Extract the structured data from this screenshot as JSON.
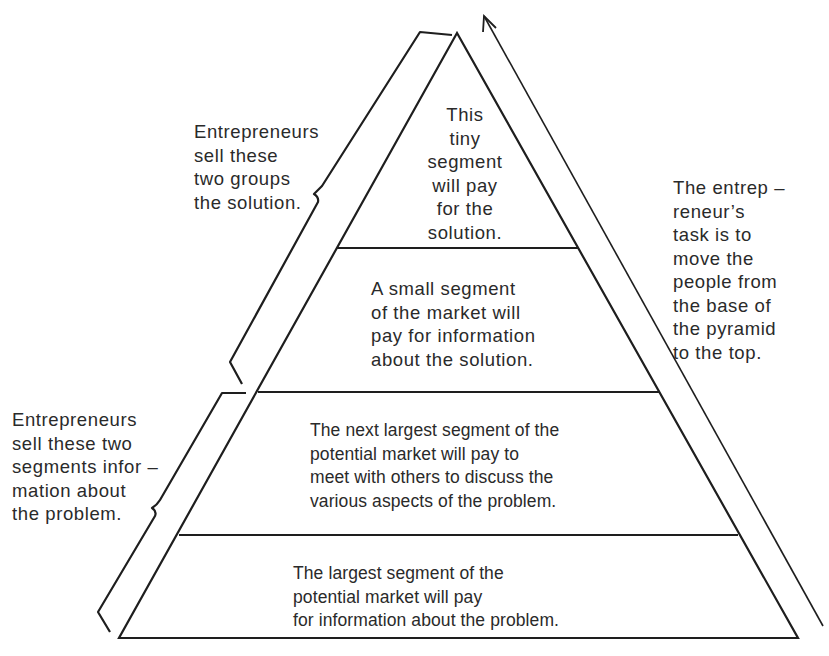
{
  "diagram": {
    "type": "market-pyramid",
    "levels": [
      {
        "id": "top",
        "label": "This\ntiny\nsegment\nwill pay\nfor the\nsolution."
      },
      {
        "id": "second",
        "label": "A small segment\nof the market will\npay for information\nabout the solution."
      },
      {
        "id": "third",
        "label": "The next largest segment of the\npotential market will pay to\nmeet with others to discuss the\nvarious aspects of the problem."
      },
      {
        "id": "base",
        "label": "The largest segment of the\npotential market will pay\nfor information about the problem."
      }
    ],
    "annotations": {
      "upper_bracket": "Entrepreneurs\nsell these\ntwo groups\nthe solution.",
      "lower_bracket": "Entrepreneurs\nsell these two\nsegments infor –\nmation about\nthe problem.",
      "arrow": "The entrep –\nreneur’s\ntask is to\nmove the\npeople from\nthe base of\nthe pyramid\nto the top."
    },
    "colors": {
      "line": "#1e1e1e",
      "text": "#2a2a2a",
      "background": "#ffffff"
    }
  }
}
